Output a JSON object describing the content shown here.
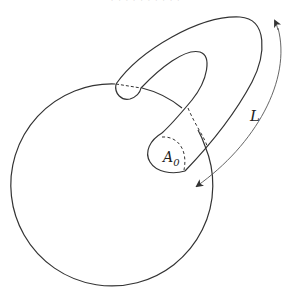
{
  "header": {
    "running_head": "· · · · · · · · · ·"
  },
  "figure": {
    "labels": {
      "length": "L",
      "area_base": "A",
      "area_sub": "0"
    },
    "colors": {
      "stroke": "#333333",
      "arrow": "#555555",
      "background": "#ffffff"
    }
  }
}
